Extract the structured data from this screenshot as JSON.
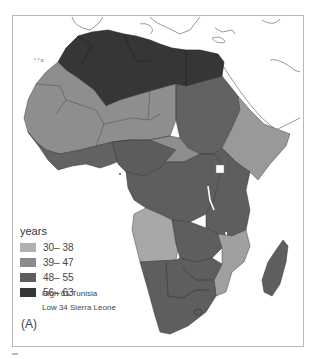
{
  "map": {
    "region": "Africa",
    "panel_label": "(A)",
    "colors": {
      "c1": "#a6a6a6",
      "c2": "#8a8a8a",
      "c3": "#5e5e5e",
      "c4": "#3a3a3a",
      "land_outline": "#8c8c8c",
      "water": "#ffffff"
    }
  },
  "legend": {
    "title": "years",
    "items": [
      {
        "label": "30– 38",
        "color": "#b0b0b0"
      },
      {
        "label": "39– 47",
        "color": "#8a8a8a"
      },
      {
        "label": "48– 55",
        "color": "#5e5e5e"
      },
      {
        "label": "56– 63",
        "color": "#363636"
      }
    ],
    "high": "High 61 Tunisia",
    "low": "Low 34 Sierra Leone"
  }
}
